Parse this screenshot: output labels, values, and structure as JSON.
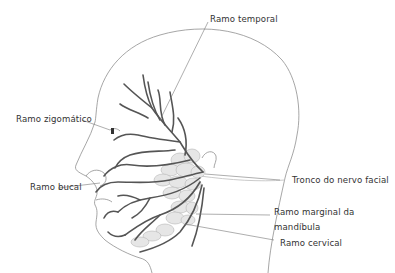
{
  "diagram": {
    "labels": {
      "temporal": "Ramo temporal",
      "zygomatic": "Ramo zigomático",
      "buccal": "Ramo bucal",
      "trunk": "Tronco do nervo facial",
      "marginal_line1": "Ramo marginal da",
      "marginal_line2": "mandíbula",
      "cervical": "Ramo cervical"
    },
    "colors": {
      "outline": "#8a8a8a",
      "nerve": "#5a5a5a",
      "gland": "#b9b9b9",
      "leader": "#777777",
      "text": "#333333"
    }
  }
}
